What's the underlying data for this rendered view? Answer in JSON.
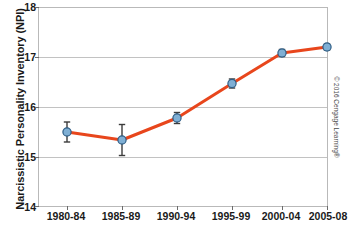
{
  "figure": {
    "credit": "© 2016 Cengage Learning®"
  },
  "chart_data": {
    "type": "line",
    "title": "",
    "subtitle": "",
    "xlabel": "",
    "ylabel": "Narcissistic Personality Inventory (NPI)",
    "categories": [
      "1980-84",
      "1985-89",
      "1990-94",
      "1995-99",
      "2000-04",
      "2005-08"
    ],
    "values": [
      15.5,
      15.34,
      15.78,
      16.47,
      17.08,
      17.2
    ],
    "error_bars": [
      0.2,
      0.31,
      0.11,
      0.09,
      0.07,
      0.06
    ],
    "ylim": [
      14,
      18
    ],
    "yticks": [
      14,
      15,
      16,
      17,
      18
    ],
    "xticks": [
      "1980-84",
      "1985-89",
      "1990-94",
      "1995-99",
      "2000-04",
      "2005-08"
    ],
    "grid": true,
    "legend": null,
    "legend_position": "none",
    "series": [
      {
        "name": "NPI score",
        "values": [
          15.5,
          15.34,
          15.78,
          16.47,
          17.08,
          17.2
        ]
      }
    ],
    "colors": {
      "line": "#E8461C",
      "marker_fill": "#7FAFD4",
      "marker_edge": "#2F5E86",
      "error_bar": "#3C3C3C",
      "grid": "#C2C2C2",
      "axis": "#B9B9B9",
      "text": "#1A1A1A"
    }
  }
}
